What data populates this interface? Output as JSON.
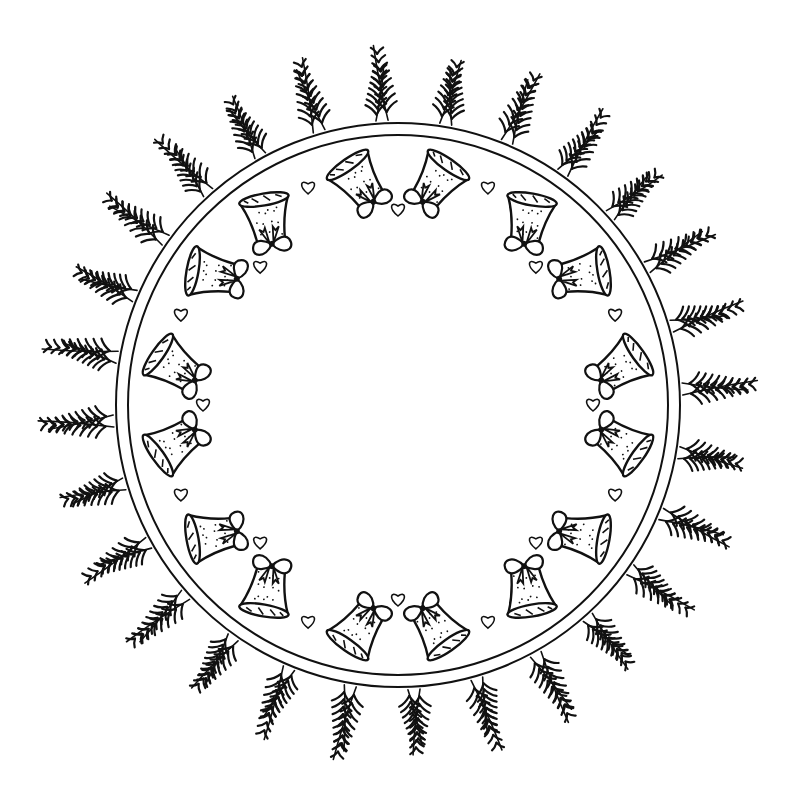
{
  "illustration": {
    "subject": "Christmas bell wreath coloring page",
    "style": "black line art on white",
    "colors": {
      "background": "#ffffff",
      "ink": "#111111"
    },
    "center": [
      398,
      405
    ],
    "wreath": {
      "inner_ring_radius": 270,
      "outer_ring_radius": 282,
      "branch_inner_radius": 285,
      "branch_outer_radius": 360,
      "branch_count": 56
    },
    "bells": {
      "count": 16,
      "pairs": 8,
      "radius": 228,
      "pair_spread_deg": 10,
      "first_pair_angle_deg": -90
    },
    "hearts": {
      "count": 16,
      "radius": 235,
      "angles_offset_deg": 22.5
    }
  }
}
